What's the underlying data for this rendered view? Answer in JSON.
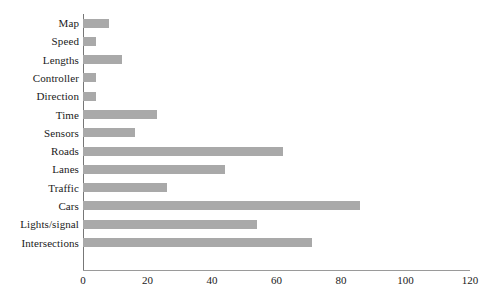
{
  "chart_data": {
    "type": "bar",
    "orientation": "horizontal",
    "title": "",
    "xlabel": "",
    "ylabel": "",
    "xlim": [
      0,
      120
    ],
    "xticks": [
      0,
      20,
      40,
      60,
      80,
      100,
      120
    ],
    "grid": false,
    "legend": null,
    "bar_color": "#a9a9a9",
    "axis_color": "#777777",
    "categories": [
      "Map",
      "Speed",
      "Lengths",
      "Controller",
      "Direction",
      "Time",
      "Sensors",
      "Roads",
      "Lanes",
      "Traffic",
      "Cars",
      "Lights/signal",
      "Intersections"
    ],
    "values": [
      8,
      4,
      12,
      4,
      4,
      23,
      16,
      62,
      44,
      26,
      86,
      54,
      71
    ]
  }
}
